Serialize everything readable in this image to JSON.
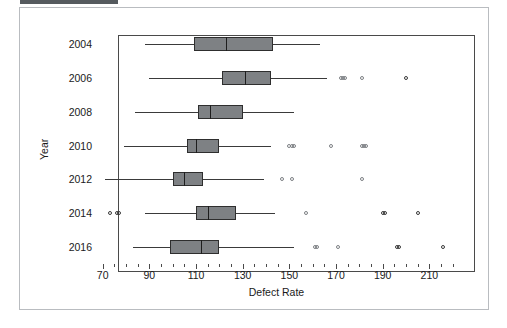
{
  "window": {
    "header_bar_color": "#555a5e",
    "faint_header_text": ""
  },
  "chart_data": {
    "type": "box",
    "title": "",
    "xlabel": "Defect Rate",
    "ylabel": "Year",
    "orientation": "horizontal",
    "xlim": [
      68,
      221
    ],
    "x_major_ticks": [
      70,
      90,
      110,
      130,
      150,
      170,
      190,
      210
    ],
    "x_minor_tick_step": 5,
    "grid": false,
    "legend": null,
    "categories": [
      "2004",
      "2006",
      "2008",
      "2010",
      "2012",
      "2014",
      "2016"
    ],
    "boxes": [
      {
        "category": "2004",
        "whisker_low": 88,
        "q1": 109,
        "median": 123,
        "q3": 143,
        "whisker_high": 163,
        "outliers": []
      },
      {
        "category": "2006",
        "whisker_low": 90,
        "q1": 121,
        "median": 131,
        "q3": 142,
        "whisker_high": 166,
        "outliers": [
          172,
          173,
          174,
          181,
          200
        ]
      },
      {
        "category": "2008",
        "whisker_low": 84,
        "q1": 111,
        "median": 116,
        "q3": 130,
        "whisker_high": 152,
        "outliers": []
      },
      {
        "category": "2010",
        "whisker_low": 79,
        "q1": 106,
        "median": 110,
        "q3": 120,
        "whisker_high": 142,
        "outliers": [
          150,
          151,
          152,
          168,
          181,
          182,
          183
        ]
      },
      {
        "category": "2012",
        "whisker_low": 71,
        "q1": 100,
        "median": 105,
        "q3": 113,
        "whisker_high": 139,
        "outliers": [
          147,
          151,
          181
        ]
      },
      {
        "category": "2014",
        "whisker_low": 88,
        "q1": 110,
        "median": 115,
        "q3": 127,
        "whisker_high": 144,
        "outliers": [
          73,
          76,
          77,
          157,
          190,
          191,
          205
        ]
      },
      {
        "category": "2016",
        "whisker_low": 83,
        "q1": 99,
        "median": 112,
        "q3": 120,
        "whisker_high": 152,
        "outliers": [
          161,
          162,
          171,
          196,
          197,
          216
        ]
      }
    ]
  }
}
